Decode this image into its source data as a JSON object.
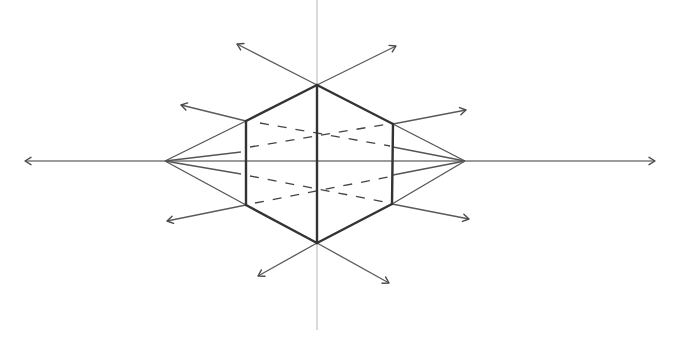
{
  "caption_clipped": "",
  "colors": {
    "background": "#ffffff",
    "edge": "#333333",
    "guide": "#8a8a8a",
    "axis": "#b5b5b5"
  },
  "horizon": {
    "y": 161,
    "x1": 25,
    "x2": 655
  },
  "vertical_axis": {
    "x": 317,
    "y1": 0,
    "y2": 330
  },
  "vanishing_points": [
    {
      "name": "left-vp",
      "x": 165,
      "y": 161
    },
    {
      "name": "right-vp",
      "x": 465,
      "y": 161
    }
  ],
  "hexagon": {
    "top": [
      317,
      85
    ],
    "upper_left": [
      246,
      121
    ],
    "upper_right": [
      393,
      124
    ],
    "bottom": [
      317,
      243
    ],
    "lower_left": [
      246,
      205
    ],
    "lower_right": [
      392,
      204
    ]
  },
  "convergence_lines": [
    [
      165,
      161,
      246,
      121
    ],
    [
      165,
      161,
      241,
      152
    ],
    [
      165,
      161,
      241,
      174
    ],
    [
      165,
      161,
      246,
      205
    ],
    [
      465,
      161,
      393,
      124
    ],
    [
      465,
      161,
      393,
      147
    ],
    [
      465,
      161,
      393,
      175
    ],
    [
      465,
      161,
      392,
      204
    ]
  ],
  "hidden_edges": [
    [
      260,
      123,
      390,
      146
    ],
    [
      250,
      147,
      388,
      124
    ],
    [
      250,
      176,
      390,
      203
    ],
    [
      255,
      203,
      388,
      177
    ]
  ],
  "radiating_arrows": [
    {
      "name": "arrow-top-left",
      "from": [
        317,
        85
      ],
      "to": [
        237,
        44
      ]
    },
    {
      "name": "arrow-top-right",
      "from": [
        317,
        85
      ],
      "to": [
        396,
        46
      ]
    },
    {
      "name": "arrow-upper-left",
      "from": [
        246,
        121
      ],
      "to": [
        181,
        105
      ]
    },
    {
      "name": "arrow-upper-right",
      "from": [
        393,
        124
      ],
      "to": [
        466,
        110
      ]
    },
    {
      "name": "arrow-lower-left",
      "from": [
        246,
        205
      ],
      "to": [
        167,
        221
      ]
    },
    {
      "name": "arrow-lower-right",
      "from": [
        392,
        204
      ],
      "to": [
        469,
        219
      ]
    },
    {
      "name": "arrow-bottom-left",
      "from": [
        317,
        243
      ],
      "to": [
        258,
        276
      ]
    },
    {
      "name": "arrow-bottom-right",
      "from": [
        317,
        243
      ],
      "to": [
        389,
        283
      ]
    }
  ]
}
